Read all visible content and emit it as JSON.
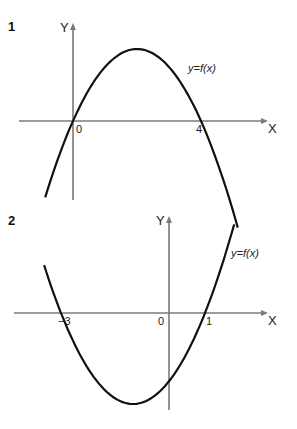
{
  "chart_data": [
    {
      "type": "line",
      "panel_number": "1",
      "curve_label": "y=f(x)",
      "xlabel": "X",
      "ylabel": "Y",
      "description": "Downward-opening parabola with roots at 0 and 4",
      "roots": [
        0,
        4
      ],
      "tick_labels": [
        "0",
        "4"
      ],
      "vertex_x": 2,
      "opens": "down",
      "grid": false
    },
    {
      "type": "line",
      "panel_number": "2",
      "curve_label": "y=f(x)",
      "xlabel": "X",
      "ylabel": "Y",
      "description": "Upward-opening parabola with roots at -3 and 1",
      "roots": [
        -3,
        1
      ],
      "tick_labels": [
        "−3",
        "0",
        "1"
      ],
      "vertex_x": -1,
      "opens": "up",
      "grid": false
    }
  ]
}
